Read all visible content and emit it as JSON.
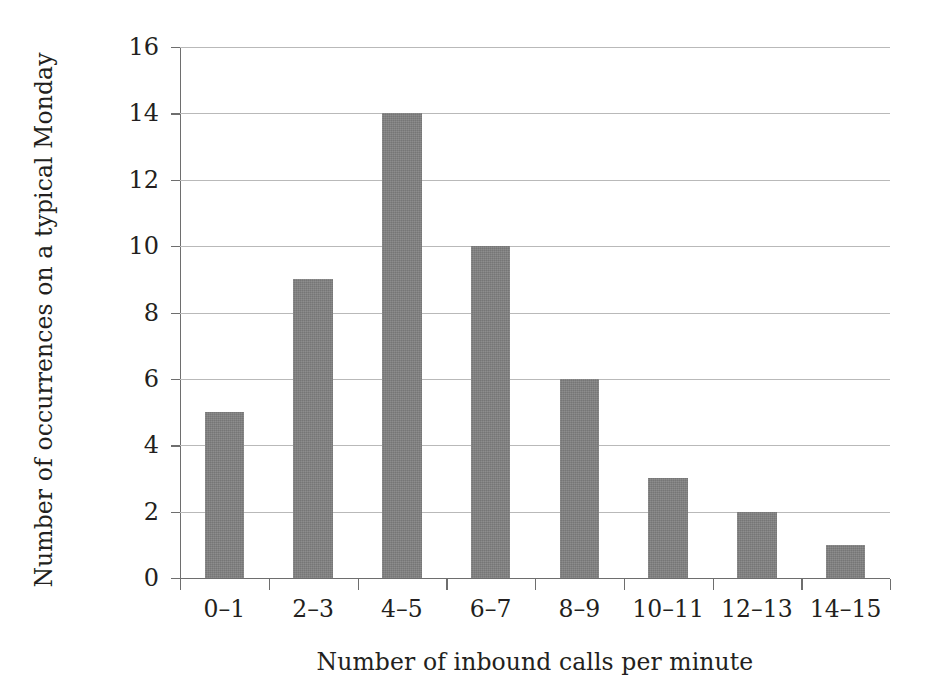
{
  "chart_data": {
    "type": "bar",
    "title": "",
    "xlabel": "Number of inbound calls per minute",
    "ylabel": "Number of occurrences on a typical Monday",
    "categories": [
      "0–1",
      "2–3",
      "4–5",
      "6–7",
      "8–9",
      "10–11",
      "12–13",
      "14–15"
    ],
    "values": [
      5,
      9,
      14,
      10,
      6,
      3,
      2,
      1
    ],
    "ylim": [
      0,
      16
    ],
    "ytick_labels": [
      "0",
      "2",
      "4",
      "6",
      "8",
      "10",
      "12",
      "14",
      "16"
    ],
    "ytick_values": [
      0,
      2,
      4,
      6,
      8,
      10,
      12,
      14,
      16
    ],
    "grid": "horizontal",
    "legend": "none",
    "bar_color": "#808080",
    "axis_color": "#6e6e6e",
    "gridline_color": "#b9b9b9",
    "background_color": "#ffffff",
    "text_color": "#231f20"
  }
}
